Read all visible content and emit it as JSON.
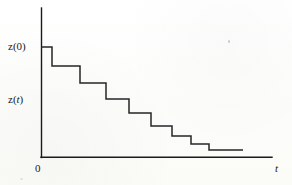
{
  "figure": {
    "title": "",
    "background_color": "#fdfdfb",
    "line_color": "#262626",
    "axis_color": "#1a1a1a"
  },
  "labels": {
    "y_initial": "z(0)",
    "y_current_prefix": "z(",
    "y_current_var": "t",
    "y_current_suffix": ")",
    "origin": "0",
    "x_axis": "t"
  },
  "chart_data": {
    "type": "line",
    "title": "",
    "xlabel": "t",
    "ylabel": "z(t)",
    "subtype": "step-decreasing",
    "grid": false,
    "legend": null,
    "axis_style": "two-axis-open",
    "xlim": [
      0,
      10
    ],
    "ylim": [
      0,
      10
    ],
    "x_tick_labels": [
      "0",
      "t"
    ],
    "y_tick_labels": [
      "z(t)",
      "z(0)"
    ],
    "series": [
      {
        "name": "z(t)",
        "step_mode": "post",
        "x": [
          0.0,
          1.0,
          2.3,
          3.5,
          4.55,
          5.55,
          6.5,
          7.4,
          8.25,
          9.25
        ],
        "y": [
          9.2,
          8.0,
          6.9,
          5.85,
          4.95,
          4.15,
          3.4,
          2.75,
          2.2,
          2.2
        ],
        "points_px": [
          [
            41,
            47
          ],
          [
            52,
            47
          ],
          [
            52,
            66
          ],
          [
            80,
            66
          ],
          [
            80,
            83
          ],
          [
            106,
            83
          ],
          [
            106,
            99
          ],
          [
            129,
            99
          ],
          [
            129,
            113
          ],
          [
            151,
            113
          ],
          [
            151,
            126
          ],
          [
            172,
            126
          ],
          [
            172,
            136
          ],
          [
            191,
            136
          ],
          [
            191,
            144
          ],
          [
            209,
            144
          ],
          [
            209,
            150
          ],
          [
            243,
            150
          ]
        ]
      }
    ],
    "marked_levels": [
      {
        "label": "z(0)",
        "value": 9.2,
        "y_px": 47
      },
      {
        "label": "z(t)",
        "value": 5.2,
        "y_px": 99
      }
    ]
  },
  "geometry": {
    "y_axis_x_px": 41,
    "y_axis_top_px": 8,
    "x_axis_y_px": 157,
    "x_axis_right_px": 272
  }
}
